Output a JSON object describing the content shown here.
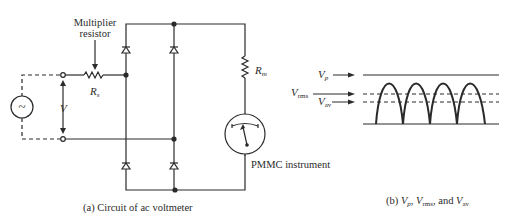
{
  "circuit": {
    "multiplier_label_line1": "Multiplier",
    "multiplier_label_line2": "resistor",
    "rs_label": "R",
    "rs_sub": "s",
    "rm_label": "R",
    "rm_sub": "m",
    "voltage_label": "V",
    "source_symbol": "~",
    "instrument_label": "PMMC instrument",
    "caption": "(a) Circuit of ac voltmeter"
  },
  "waveform": {
    "vp_label": "V",
    "vp_sub": "p",
    "vrms_label": "V",
    "vrms_sub": "rms",
    "vav_label": "V",
    "vav_sub": "av",
    "caption_prefix": "(b) ",
    "caption_vp": "V",
    "caption_vp_sub": "p",
    "caption_sep1": ", ",
    "caption_vrms": "V",
    "caption_vrms_sub": "rms",
    "caption_sep2": ", and ",
    "caption_vav": "V",
    "caption_vav_sub": "av",
    "num_half_cycles": 4
  },
  "colors": {
    "ink": "#2a2a2a",
    "background": "#ffffff"
  }
}
